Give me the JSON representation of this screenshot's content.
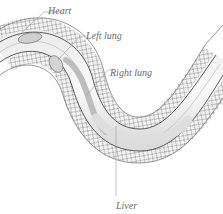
{
  "diagram": {
    "labels": [
      {
        "id": "heart",
        "text": "Heart"
      },
      {
        "id": "left-lung",
        "text": "Left lung"
      },
      {
        "id": "right-lung",
        "text": "Right lung"
      },
      {
        "id": "liver",
        "text": "Liver"
      }
    ]
  },
  "colors": {
    "background": "#ffffff",
    "outline": "#555555",
    "scales": "#7a7a7a",
    "organ_fill": "#d8d8d8",
    "label_text": "#6a6a6a",
    "leader_line": "#9a9a9a"
  }
}
